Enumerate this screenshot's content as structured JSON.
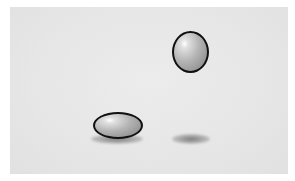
{
  "scene": {
    "description": "Two gray glossy balls: one airborne and round, one squashed on the ground",
    "background_color": "#e6e6e6",
    "objects": [
      {
        "id": "airborne-ball",
        "shape": "ellipse",
        "state": "airborne",
        "color": "#a8a8a8",
        "outline": "#111111"
      },
      {
        "id": "squashed-ball",
        "shape": "flattened-ellipse",
        "state": "on-ground",
        "color": "#a8a8a8",
        "outline": "#111111"
      },
      {
        "id": "airborne-ball-shadow",
        "color": "#8a8a8a"
      },
      {
        "id": "squashed-ball-shadow",
        "color": "#7a7a7a"
      }
    ]
  }
}
